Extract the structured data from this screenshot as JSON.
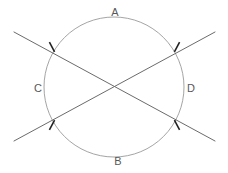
{
  "figure": {
    "type": "geometry-diagram",
    "width": 228,
    "height": 173,
    "background_color": "#ffffff"
  },
  "colors": {
    "circle_stroke": "#9a9a9a",
    "line_stroke": "#6b6b6b",
    "tick_stroke": "#222222",
    "label_text": "#585858"
  },
  "circle": {
    "name": "main-circle",
    "center_x": 114,
    "center_y": 87,
    "radius": 70,
    "stroke_width": 0.9
  },
  "arc_labels": [
    {
      "id": "A",
      "text": "A",
      "x": 115,
      "y": 12,
      "position": "top"
    },
    {
      "id": "B",
      "text": "B",
      "x": 118,
      "y": 161,
      "position": "bottom"
    },
    {
      "id": "C",
      "text": "C",
      "x": 38,
      "y": 88,
      "position": "left"
    },
    {
      "id": "D",
      "text": "D",
      "x": 191,
      "y": 88,
      "position": "right"
    }
  ],
  "secant_lines": [
    {
      "id": "line-1",
      "description": "Secant from upper-left to lower-right",
      "x1": 14,
      "y1": 32,
      "x2": 215,
      "y2": 141,
      "stroke_width": 1.0
    },
    {
      "id": "line-2",
      "description": "Secant from lower-left to upper-right",
      "x1": 14,
      "y1": 141,
      "x2": 215,
      "y2": 32,
      "stroke_width": 1.0
    }
  ],
  "intersection_points": [
    {
      "id": "top-left",
      "x": 52,
      "y": 47,
      "has_tick": true,
      "tick_angle": 62
    },
    {
      "id": "top-right",
      "x": 177,
      "y": 47,
      "has_tick": true,
      "tick_angle": 118
    },
    {
      "id": "bottom-left",
      "x": 52,
      "y": 125,
      "has_tick": true,
      "tick_angle": 118
    },
    {
      "id": "bottom-right",
      "x": 177,
      "y": 125,
      "has_tick": true,
      "tick_angle": 62
    }
  ],
  "tick_marks": {
    "count": 4,
    "length": 11,
    "stroke_width": 1.6,
    "meaning": "congruence-hash-mark"
  },
  "center_crossing": {
    "x": 114,
    "y": 87,
    "has_tick": false
  }
}
